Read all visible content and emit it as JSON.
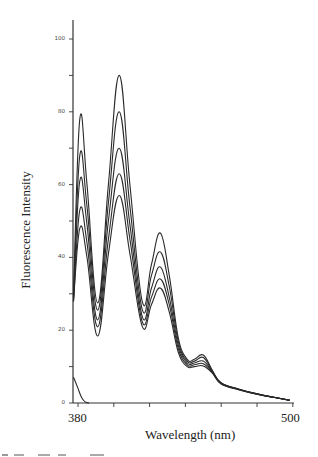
{
  "chart_data": {
    "type": "line",
    "title": "",
    "xlabel": "Wavelength (nm)",
    "ylabel": "Fluorescence Intensity",
    "xlim": [
      377,
      500
    ],
    "ylim": [
      0,
      105
    ],
    "x_tick_labels": [
      "380",
      "500"
    ],
    "x_ticks": [
      380,
      400,
      420,
      440,
      460,
      480,
      500
    ],
    "y_tick_labels": [
      "0",
      "20",
      "40",
      "60",
      "80",
      "100"
    ],
    "y_minor_ticks": [
      10,
      30,
      50,
      70,
      90
    ],
    "grid": false,
    "legend": null,
    "x": [
      377,
      381,
      385,
      391,
      397,
      403,
      409,
      416,
      421,
      426,
      431,
      436,
      441,
      445,
      450,
      455,
      460,
      470,
      480,
      490,
      498
    ],
    "series": [
      {
        "name": "curve 1",
        "values": [
          30,
          78,
          60,
          27.5,
          60,
          90,
          60,
          27.7,
          38,
          46.7,
          35,
          18,
          12,
          12,
          13.2,
          9,
          5.5,
          3.8,
          2.5,
          1.5,
          0.8
        ]
      },
      {
        "name": "curve 2",
        "values": [
          29,
          68,
          54,
          25.5,
          55,
          80,
          54,
          25.5,
          35,
          41.5,
          32,
          17,
          11.5,
          11.5,
          12.5,
          8.8,
          5.5,
          3.8,
          2.5,
          1.5,
          0.8
        ]
      },
      {
        "name": "curve 3",
        "values": [
          28.5,
          61,
          49,
          22.8,
          50,
          70,
          49,
          23.6,
          31.5,
          37.4,
          29,
          16,
          11,
          11,
          11.5,
          8.6,
          5.4,
          3.7,
          2.5,
          1.5,
          0.8
        ]
      },
      {
        "name": "curve 4",
        "values": [
          28,
          53,
          44,
          20.9,
          45,
          63,
          45,
          22.2,
          29,
          34.1,
          27,
          15,
          10.5,
          10.5,
          10.8,
          8.4,
          5.3,
          3.7,
          2.4,
          1.5,
          0.8
        ]
      },
      {
        "name": "curve 5",
        "values": [
          28,
          48,
          40,
          18.4,
          41,
          57,
          41,
          20.9,
          27,
          31.6,
          25,
          14,
          10,
          10,
          10.2,
          8.2,
          5.2,
          3.6,
          2.4,
          1.5,
          0.8
        ]
      },
      {
        "name": "blank",
        "x": [
          377,
          378,
          380,
          382,
          384,
          386
        ],
        "values": [
          7,
          6.5,
          4,
          1.5,
          0.3,
          0
        ]
      }
    ]
  },
  "axes": {
    "xlabel": "Wavelength (nm)",
    "ylabel": "Fluorescence Intensity",
    "x_tick_labels": [
      {
        "text": "380",
        "x": 68
      },
      {
        "text": "500",
        "x": 281
      }
    ],
    "y_tick_labels": [
      {
        "text": "100",
        "y": 39
      },
      {
        "text": "80",
        "y": 112
      },
      {
        "text": "60",
        "y": 185
      },
      {
        "text": "40",
        "y": 257
      },
      {
        "text": "20",
        "y": 330
      },
      {
        "text": "0",
        "y": 403
      }
    ]
  },
  "style": {
    "line_color": "#2a2a2a",
    "axis_color": "#333333",
    "background": "#ffffff"
  }
}
